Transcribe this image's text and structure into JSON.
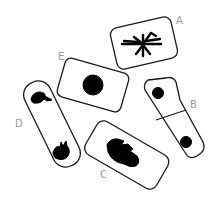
{
  "diagram": {
    "title": "",
    "colors": {
      "outline": "#1a1a1a",
      "chromatin": "#000000",
      "label": "#9a9a9a",
      "background": "#ffffff"
    },
    "cells": [
      {
        "id": "A",
        "label": "A",
        "content": "chromosomes condensed, spread (prophase/metaphase)"
      },
      {
        "id": "B",
        "label": "B",
        "content": "two daughter cells with nuclei, cell plate formed (telophase/cytokinesis)"
      },
      {
        "id": "C",
        "label": "C",
        "content": "chromosomes aligned at center (metaphase)"
      },
      {
        "id": "D",
        "label": "D",
        "content": "chromosomes at opposite poles (anaphase/telophase)"
      },
      {
        "id": "E",
        "label": "E",
        "content": "single round nucleus (interphase)"
      }
    ]
  }
}
